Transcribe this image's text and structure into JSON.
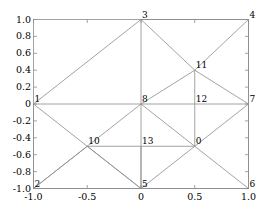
{
  "chart_data": {
    "type": "scatter",
    "title": "",
    "xlabel": "",
    "ylabel": "",
    "xlim": [
      -1.0,
      1.0
    ],
    "ylim": [
      -1.0,
      1.0
    ],
    "grid": false,
    "legend": null,
    "xticks": [
      "-1.0",
      "-0.5",
      "0",
      "0.5",
      "1.0"
    ],
    "xtick_values": [
      -1.0,
      -0.5,
      0,
      0.5,
      1.0
    ],
    "yticks": [
      "1.0",
      "0.8",
      "0.6",
      "0.4",
      "0.2",
      "0",
      "-0.2",
      "-0.4",
      "-0.6",
      "-0.8",
      "-1.0"
    ],
    "ytick_values": [
      1.0,
      0.8,
      0.6,
      0.4,
      0.2,
      0,
      -0.2,
      -0.4,
      -0.6,
      -0.8,
      -1.0
    ],
    "nodes": [
      {
        "id": "0",
        "x": 0.5,
        "y": -0.5
      },
      {
        "id": "1",
        "x": -1.0,
        "y": 0.0
      },
      {
        "id": "2",
        "x": -1.0,
        "y": -1.0
      },
      {
        "id": "3",
        "x": 0.0,
        "y": 1.0
      },
      {
        "id": "4",
        "x": 1.0,
        "y": 1.0
      },
      {
        "id": "5",
        "x": 0.0,
        "y": -1.0
      },
      {
        "id": "6",
        "x": 1.0,
        "y": -1.0
      },
      {
        "id": "7",
        "x": 1.0,
        "y": 0.0
      },
      {
        "id": "8",
        "x": 0.0,
        "y": 0.0
      },
      {
        "id": "10",
        "x": -0.5,
        "y": -0.5
      },
      {
        "id": "11",
        "x": 0.5,
        "y": 0.4
      },
      {
        "id": "12",
        "x": 0.5,
        "y": 0.0
      },
      {
        "id": "13",
        "x": 0.0,
        "y": -0.5
      }
    ],
    "edges": [
      [
        "1",
        "3"
      ],
      [
        "3",
        "4"
      ],
      [
        "4",
        "7"
      ],
      [
        "7",
        "6"
      ],
      [
        "6",
        "5"
      ],
      [
        "5",
        "2"
      ],
      [
        "2",
        "1"
      ],
      [
        "1",
        "8"
      ],
      [
        "8",
        "12"
      ],
      [
        "12",
        "7"
      ],
      [
        "3",
        "8"
      ],
      [
        "8",
        "5"
      ],
      [
        "3",
        "11"
      ],
      [
        "11",
        "4"
      ],
      [
        "11",
        "12"
      ],
      [
        "11",
        "7"
      ],
      [
        "8",
        "11"
      ],
      [
        "1",
        "5"
      ],
      [
        "2",
        "8"
      ],
      [
        "10",
        "13"
      ],
      [
        "13",
        "0"
      ],
      [
        "0",
        "12"
      ],
      [
        "0",
        "7"
      ],
      [
        "0",
        "6"
      ],
      [
        "0",
        "5"
      ],
      [
        "13",
        "5"
      ],
      [
        "8",
        "0"
      ],
      [
        "2",
        "10"
      ],
      [
        "10",
        "5"
      ]
    ],
    "edge_color": "#8c8c8c",
    "axis_color": "#8c8c8c"
  }
}
